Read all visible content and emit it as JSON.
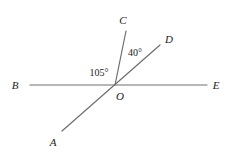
{
  "figure": {
    "type": "geometry-diagram",
    "background_color": "#ffffff",
    "stroke_color": "#6e6e6e",
    "text_color": "#1a1a1a",
    "width": 230,
    "height": 157,
    "vertex": {
      "name": "O",
      "x": 115,
      "y": 85
    },
    "points": [
      {
        "id": "A",
        "label": "A",
        "x": 53,
        "y": 142,
        "ray_end_x": 62,
        "ray_end_y": 131
      },
      {
        "id": "B",
        "label": "B",
        "x": 15,
        "y": 85,
        "ray_end_x": 30,
        "ray_end_y": 85
      },
      {
        "id": "C",
        "label": "C",
        "x": 123,
        "y": 20,
        "ray_end_x": 126,
        "ray_end_y": 31
      },
      {
        "id": "D",
        "label": "D",
        "x": 169,
        "y": 39,
        "ray_end_x": 160,
        "ray_end_y": 45
      },
      {
        "id": "E",
        "label": "E",
        "x": 216,
        "y": 85,
        "ray_end_x": 207,
        "ray_end_y": 85
      },
      {
        "id": "O",
        "label": "O",
        "x": 120,
        "y": 96,
        "ray_end_x": 115,
        "ray_end_y": 85
      }
    ],
    "segments": [
      {
        "id": "line-BE",
        "from": "B",
        "to": "E",
        "x1": 30,
        "y1": 85,
        "x2": 207,
        "y2": 85
      },
      {
        "id": "line-AD",
        "from": "A",
        "to": "D",
        "x1": 62,
        "y1": 131,
        "x2": 160,
        "y2": 45
      },
      {
        "id": "ray-OC",
        "from": "O",
        "to": "C",
        "x1": 115,
        "y1": 85,
        "x2": 126,
        "y2": 31
      }
    ],
    "angles": [
      {
        "id": "angle-BOC",
        "label": "105°",
        "value": 105,
        "unit": "degrees",
        "between": [
          "B",
          "C"
        ],
        "x": 99,
        "y": 73
      },
      {
        "id": "angle-COD",
        "label": "40°",
        "value": 40,
        "unit": "degrees",
        "between": [
          "C",
          "D"
        ],
        "x": 135,
        "y": 53
      }
    ]
  }
}
